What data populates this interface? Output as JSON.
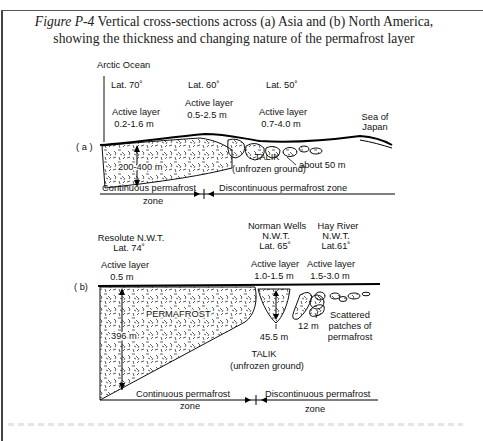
{
  "caption": {
    "figure_label": "Figure P-4",
    "text": " Vertical cross-sections across (a) Asia and (b) North America, showing the thickness and changing nature of the permafrost layer"
  },
  "diagram_a": {
    "panel_label": "( a )",
    "arctic_ocean": "Arctic Ocean",
    "lat1": "Lat. 70˚",
    "lat2": "Lat. 60˚",
    "lat3": "Lat. 50˚",
    "active1_title": "Active layer",
    "active1_value": "0.2-1.6 m",
    "active2_title": "Active layer",
    "active2_value": "0.5-2.5 m",
    "active3_title": "Active layer",
    "active3_value": "0.7-4.0 m",
    "sea_line1": "Sea of",
    "sea_line2": "Japan",
    "thickness": "200-400 m",
    "talik_title": "TALIK",
    "talik_sub": "(unfrozen ground)",
    "about": "about 50 m",
    "continuous_line1": "Continuous permafrost",
    "continuous_line2": "zone",
    "discontinuous": "Discontinuous permafrost zone"
  },
  "diagram_b": {
    "panel_label": "( b)",
    "resolute_name": "Resolute N.W.T.",
    "resolute_lat": "Lat. 74˚",
    "norman_name": "Norman Wells",
    "norman_region": "N.W.T.",
    "norman_lat": "Lat. 65˚",
    "hay_name": "Hay River",
    "hay_region": "N.W.T.",
    "hay_lat": "Lat.61˚",
    "active1_title": "Active layer",
    "active1_value": "0.5 m",
    "active2_title": "Active layer",
    "active2_value": "1.0-1.5 m",
    "active3_title": "Active layer",
    "active3_value": "1.5-3.0 m",
    "permafrost": "PERMAFROST",
    "thickness": "396 m",
    "depth_norman": "45.5 m",
    "depth_hay": "12 m",
    "scattered_1": "Scattered",
    "scattered_2": "patches of",
    "scattered_3": "permafrost",
    "talik_title": "TALIK",
    "talik_sub": "(unfrozen ground)",
    "continuous_line1": "Continuous permafrost",
    "continuous_line2": "zone",
    "discontinuous_line1": "Discontinuous permafrost",
    "discontinuous_line2": "zone"
  }
}
